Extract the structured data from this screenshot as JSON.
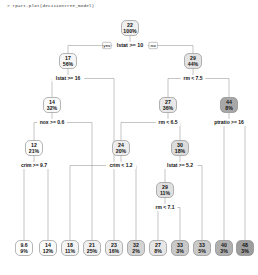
{
  "console": {
    "prompt_line": "> rpart.plot(decisiontree_model)"
  },
  "plot": {
    "type": "decision-tree",
    "yes_label": "yes",
    "no_label": "no",
    "palette": {
      "lightest": "#ffffff",
      "light": "#f2f2f2",
      "mid": "#d8d8d8",
      "dark": "#b8b8b8",
      "darkest": "#9e9e9e",
      "stroke": "#6f6f6f",
      "edge": "#8a8a8a",
      "text": "#111111"
    }
  },
  "chart_data": {
    "type": "tree",
    "title": "",
    "root_split": "lstat >= 10",
    "nodes": [
      {
        "id": "n1",
        "value": "22",
        "pct": "100%",
        "split": "lstat >= 10",
        "x": 130,
        "y": 28,
        "fill": "#efefef",
        "leaf": false
      },
      {
        "id": "n2",
        "value": "17",
        "pct": "56%",
        "split": "lstat >= 16",
        "x": 68,
        "y": 61,
        "fill": "#f6f6f6",
        "leaf": false
      },
      {
        "id": "n3",
        "value": "29",
        "pct": "44%",
        "split": "rm < 7.5",
        "x": 193,
        "y": 61,
        "fill": "#e3e3e3",
        "leaf": false
      },
      {
        "id": "n4",
        "value": "14",
        "pct": "32%",
        "split": "nox >= 0.6",
        "x": 52,
        "y": 105,
        "fill": "#fafafa",
        "leaf": false
      },
      {
        "id": "n5",
        "value": "27",
        "pct": "36%",
        "split": "rm < 6.5",
        "x": 168,
        "y": 105,
        "fill": "#e8e8e8",
        "leaf": false
      },
      {
        "id": "n6",
        "value": "44",
        "pct": "8%",
        "split": "ptratio >= 16",
        "x": 229,
        "y": 105,
        "fill": "#a8a8a8",
        "leaf": false
      },
      {
        "id": "n7",
        "value": "12",
        "pct": "21%",
        "split": "crim >= 9.7",
        "x": 34,
        "y": 148,
        "fill": "#fdfdfd",
        "leaf": false
      },
      {
        "id": "n8",
        "value": "24",
        "pct": "20%",
        "split": "crim < 1.2",
        "x": 121,
        "y": 148,
        "fill": "#ededed",
        "leaf": false
      },
      {
        "id": "n9",
        "value": "30",
        "pct": "18%",
        "split": "lstat >= 5.2",
        "x": 180,
        "y": 148,
        "fill": "#dcdcdc",
        "leaf": false
      },
      {
        "id": "n10",
        "value": "29",
        "pct": "11%",
        "split": "rm < 7.1",
        "x": 165,
        "y": 190,
        "fill": "#e0e0e0",
        "leaf": false
      },
      {
        "id": "L1",
        "value": "9.6",
        "pct": "9%",
        "split": "",
        "x": 24,
        "y": 248,
        "fill": "#ffffff",
        "leaf": true
      },
      {
        "id": "L2",
        "value": "14",
        "pct": "12%",
        "split": "",
        "x": 48,
        "y": 248,
        "fill": "#fafafa",
        "leaf": true
      },
      {
        "id": "L3",
        "value": "18",
        "pct": "11%",
        "split": "",
        "x": 70,
        "y": 248,
        "fill": "#f4f4f4",
        "leaf": true
      },
      {
        "id": "L4",
        "value": "21",
        "pct": "25%",
        "split": "",
        "x": 92,
        "y": 248,
        "fill": "#f0f0f0",
        "leaf": true
      },
      {
        "id": "L5",
        "value": "23",
        "pct": "16%",
        "split": "",
        "x": 114,
        "y": 248,
        "fill": "#ececec",
        "leaf": true
      },
      {
        "id": "L6",
        "value": "32",
        "pct": "2%",
        "split": "",
        "x": 136,
        "y": 248,
        "fill": "#d4d4d4",
        "leaf": true
      },
      {
        "id": "L7",
        "value": "27",
        "pct": "8%",
        "split": "",
        "x": 158,
        "y": 248,
        "fill": "#e6e6e6",
        "leaf": true
      },
      {
        "id": "L8",
        "value": "33",
        "pct": "3%",
        "split": "",
        "x": 180,
        "y": 248,
        "fill": "#c9c9c9",
        "leaf": true
      },
      {
        "id": "L9",
        "value": "33",
        "pct": "5%",
        "split": "",
        "x": 202,
        "y": 248,
        "fill": "#c9c9c9",
        "leaf": true
      },
      {
        "id": "L10",
        "value": "40",
        "pct": "3%",
        "split": "",
        "x": 224,
        "y": 248,
        "fill": "#b0b0b0",
        "leaf": true
      },
      {
        "id": "L11",
        "value": "48",
        "pct": "3%",
        "split": "",
        "x": 245,
        "y": 248,
        "fill": "#9e9e9e",
        "leaf": true
      }
    ],
    "edges": [
      {
        "from": "n1",
        "to": "n2"
      },
      {
        "from": "n1",
        "to": "n3"
      },
      {
        "from": "n2",
        "to": "n4"
      },
      {
        "from": "n2",
        "to": "L5"
      },
      {
        "from": "n3",
        "to": "n5"
      },
      {
        "from": "n3",
        "to": "n6"
      },
      {
        "from": "n4",
        "to": "n7"
      },
      {
        "from": "n4",
        "to": "L4"
      },
      {
        "from": "n5",
        "to": "n8"
      },
      {
        "from": "n5",
        "to": "n9"
      },
      {
        "from": "n6",
        "to": "L10"
      },
      {
        "from": "n6",
        "to": "L11"
      },
      {
        "from": "n7",
        "to": "L1"
      },
      {
        "from": "n7",
        "to": "L2"
      },
      {
        "from": "n8",
        "to": "L6"
      },
      {
        "from": "n8",
        "to": "L3"
      },
      {
        "from": "n9",
        "to": "n10"
      },
      {
        "from": "n9",
        "to": "L9"
      },
      {
        "from": "n10",
        "to": "L7"
      },
      {
        "from": "n10",
        "to": "L8"
      }
    ]
  }
}
